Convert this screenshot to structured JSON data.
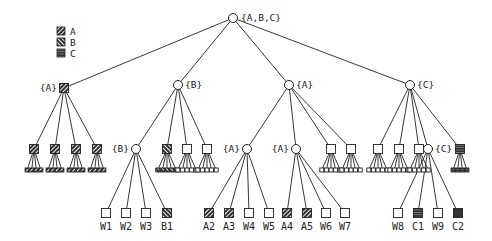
{
  "legend": {
    "items": [
      {
        "label": "A",
        "pattern": "hatch-a"
      },
      {
        "label": "B",
        "pattern": "hatch-b"
      },
      {
        "label": "C",
        "pattern": "hatch-c"
      }
    ]
  },
  "tree": {
    "root": {
      "label": "{A,B,C}",
      "shape": "circle",
      "x": 233,
      "y": 18
    },
    "level1": [
      {
        "id": "L1A",
        "label": "{A}",
        "shape": "square",
        "fill": "hatch-a",
        "x": 64,
        "y": 88
      },
      {
        "id": "L1B",
        "label": "{B}",
        "shape": "circle",
        "x": 178,
        "y": 85
      },
      {
        "id": "L1A2",
        "label": "{A}",
        "shape": "circle",
        "x": 289,
        "y": 85
      },
      {
        "id": "L1C",
        "label": "{C}",
        "shape": "circle",
        "x": 410,
        "y": 85
      }
    ],
    "level2": [
      {
        "parent": "L1A",
        "shape": "square",
        "fill": "hatch-a",
        "x": 34,
        "y": 149,
        "leaves": 4,
        "leaf_fill": "hatch-a"
      },
      {
        "parent": "L1A",
        "shape": "square",
        "fill": "hatch-a",
        "x": 55,
        "y": 149,
        "leaves": 4,
        "leaf_fill": "hatch-a"
      },
      {
        "parent": "L1A",
        "shape": "square",
        "fill": "hatch-a",
        "x": 76,
        "y": 149,
        "leaves": 4,
        "leaf_fill": "hatch-a"
      },
      {
        "parent": "L1A",
        "shape": "square",
        "fill": "hatch-a",
        "x": 97,
        "y": 149,
        "leaves": 4,
        "leaf_fill": "hatch-a"
      },
      {
        "id": "L2B",
        "parent": "L1B",
        "label": "{B}",
        "shape": "circle",
        "x": 136,
        "y": 149
      },
      {
        "parent": "L1B",
        "shape": "square",
        "fill": "hatch-b",
        "x": 167,
        "y": 149,
        "leaves": 5,
        "leaf_fill": "hatch-b"
      },
      {
        "parent": "L1B",
        "shape": "square",
        "fill": "white",
        "x": 187,
        "y": 149,
        "leaves": 5,
        "leaf_fill": "white"
      },
      {
        "parent": "L1B",
        "shape": "square",
        "fill": "white",
        "x": 207,
        "y": 149,
        "leaves": 5,
        "leaf_fill": "white"
      },
      {
        "id": "L2A1",
        "parent": "L1A2",
        "label": "{A}",
        "shape": "circle",
        "x": 247,
        "y": 149
      },
      {
        "id": "L2A2",
        "parent": "L1A2",
        "label": "{A}",
        "shape": "circle",
        "x": 296,
        "y": 149
      },
      {
        "parent": "L1A2",
        "shape": "square",
        "fill": "white",
        "x": 331,
        "y": 149,
        "leaves": 5,
        "leaf_fill": "white"
      },
      {
        "parent": "L1A2",
        "shape": "square",
        "fill": "white",
        "x": 351,
        "y": 149,
        "leaves": 5,
        "leaf_fill": "white"
      },
      {
        "parent": "L1C",
        "shape": "square",
        "fill": "white",
        "x": 378,
        "y": 149,
        "leaves": 5,
        "leaf_fill": "white"
      },
      {
        "parent": "L1C",
        "shape": "square",
        "fill": "white",
        "x": 399,
        "y": 149,
        "leaves": 5,
        "leaf_fill": "white"
      },
      {
        "parent": "L1C",
        "shape": "square",
        "fill": "white",
        "x": 419,
        "y": 149,
        "leaves": 5,
        "leaf_fill": "white"
      },
      {
        "id": "L2C",
        "parent": "L1C",
        "label": "{C}",
        "shape": "circle",
        "x": 428,
        "y": 149
      },
      {
        "parent": "L1C",
        "shape": "square",
        "fill": "hatch-c",
        "x": 460,
        "y": 149,
        "leaves": 4,
        "leaf_fill": "hatch-c"
      }
    ],
    "level3_labeled": [
      {
        "parent": "L2B",
        "label": "W1",
        "fill": "white",
        "x": 106,
        "y": 213
      },
      {
        "parent": "L2B",
        "label": "W2",
        "fill": "white",
        "x": 126,
        "y": 213
      },
      {
        "parent": "L2B",
        "label": "W3",
        "fill": "white",
        "x": 146,
        "y": 213
      },
      {
        "parent": "L2B",
        "label": "B1",
        "fill": "hatch-b",
        "x": 167,
        "y": 213
      },
      {
        "parent": "L2A1",
        "label": "A2",
        "fill": "hatch-a",
        "x": 209,
        "y": 213
      },
      {
        "parent": "L2A1",
        "label": "A3",
        "fill": "hatch-a",
        "x": 229,
        "y": 213
      },
      {
        "parent": "L2A1",
        "label": "W4",
        "fill": "white",
        "x": 249,
        "y": 213
      },
      {
        "parent": "L2A1",
        "label": "W5",
        "fill": "white",
        "x": 269,
        "y": 213
      },
      {
        "parent": "L2A2",
        "label": "A4",
        "fill": "hatch-a",
        "x": 287,
        "y": 213
      },
      {
        "parent": "L2A2",
        "label": "A5",
        "fill": "hatch-a",
        "x": 307,
        "y": 213
      },
      {
        "parent": "L2A2",
        "label": "W6",
        "fill": "white",
        "x": 326,
        "y": 213
      },
      {
        "parent": "L2A2",
        "label": "W7",
        "fill": "white",
        "x": 345,
        "y": 213
      },
      {
        "parent": "L2C",
        "label": "W8",
        "fill": "white",
        "x": 398,
        "y": 213
      },
      {
        "parent": "L2C",
        "label": "C1",
        "fill": "hatch-c",
        "x": 418,
        "y": 213
      },
      {
        "parent": "L2C",
        "label": "W9",
        "fill": "white",
        "x": 438,
        "y": 213
      },
      {
        "parent": "L2C",
        "label": "C2",
        "fill": "dark",
        "x": 458,
        "y": 213
      }
    ]
  },
  "colors": {
    "line": "#222222",
    "dark_fill": "#333333",
    "background": "#ffffff"
  }
}
